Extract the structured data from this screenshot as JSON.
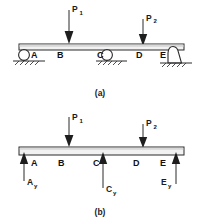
{
  "figure": {
    "title_a": "(a)",
    "title_b": "(b)",
    "panels": [
      {
        "id": "a",
        "caption": "(a)",
        "type": "supported-beam-diagram",
        "loads": [
          {
            "name": "P1",
            "label": "P",
            "subscript": "1",
            "direction": "down",
            "x": 69,
            "point": "B-C"
          },
          {
            "name": "P2",
            "label": "P",
            "subscript": "2",
            "direction": "down",
            "x": 143,
            "point": "D-E"
          }
        ],
        "points": [
          {
            "label": "A",
            "x": 28,
            "support": "roller"
          },
          {
            "label": "B",
            "x": 57,
            "support": "none"
          },
          {
            "label": "C",
            "x": 101,
            "support": "roller"
          },
          {
            "label": "D",
            "x": 137,
            "support": "none"
          },
          {
            "label": "E",
            "x": 163,
            "support": "pin"
          }
        ]
      },
      {
        "id": "b",
        "caption": "(b)",
        "type": "free-body-diagram",
        "loads": [
          {
            "name": "P1",
            "label": "P",
            "subscript": "1",
            "direction": "down",
            "x": 69
          },
          {
            "name": "P2",
            "label": "P",
            "subscript": "2",
            "direction": "down",
            "x": 143
          }
        ],
        "reactions": [
          {
            "name": "Ay",
            "label": "A",
            "subscript": "y",
            "direction": "up",
            "x": 24
          },
          {
            "name": "Cy",
            "label": "C",
            "subscript": "y",
            "direction": "up",
            "x": 103
          },
          {
            "name": "Ey",
            "label": "E",
            "subscript": "y",
            "direction": "up",
            "x": 172
          }
        ],
        "points": [
          {
            "label": "A",
            "x": 33
          },
          {
            "label": "B",
            "x": 60
          },
          {
            "label": "C",
            "x": 96
          },
          {
            "label": "D",
            "x": 136
          },
          {
            "label": "E",
            "x": 163
          }
        ]
      }
    ],
    "colors": {
      "ink": "#1e1e1e",
      "beam_face": "#f2f2f2",
      "beam_shade": "#d8d8d8",
      "background": "#ffffff"
    }
  }
}
